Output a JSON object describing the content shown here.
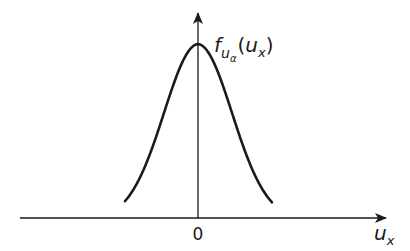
{
  "diagram": {
    "curve": {
      "type": "bell",
      "center": 0
    },
    "y_axis_label": {
      "main": "f",
      "sub": "u",
      "subsub": "α",
      "paren_open": "(",
      "arg": "u",
      "arg_sub": "x",
      "paren_close": ")"
    },
    "x_axis_label": {
      "main": "u",
      "sub": "x"
    },
    "origin_label": "0"
  }
}
